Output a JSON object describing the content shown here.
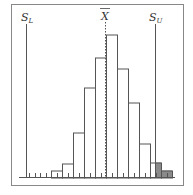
{
  "chart_data": {
    "type": "bar",
    "title": "",
    "xlabel": "",
    "ylabel": "",
    "categories": [
      "1",
      "2",
      "3",
      "4",
      "5",
      "6",
      "7",
      "8",
      "9",
      "10",
      "11"
    ],
    "values": [
      1,
      2,
      6,
      12,
      16,
      19,
      14,
      10,
      5,
      2,
      1
    ],
    "relative_heights_px": [
      7,
      14,
      45,
      90,
      120,
      143,
      109,
      75,
      34,
      15,
      7
    ],
    "shaded_bins": [
      "10 (portion beyond S_U)",
      "11"
    ],
    "annotations": [
      {
        "label": "S_L",
        "type": "vertical-line",
        "meaning": "lower specification limit"
      },
      {
        "label": "X̄",
        "type": "dashed-vertical-line",
        "meaning": "mean"
      },
      {
        "label": "S_U",
        "type": "vertical-line",
        "meaning": "upper specification limit"
      }
    ],
    "grid": false,
    "legend": "none"
  },
  "labels": {
    "lower_main": "S",
    "lower_sub": "L",
    "mean": "X",
    "upper_main": "S",
    "upper_sub": "U"
  },
  "colors": {
    "frame": "#888888",
    "bars_stroke": "#555555",
    "bar_fill": "#ffffff",
    "shaded_fill": "#8a8a8a",
    "lines": "#555555"
  }
}
